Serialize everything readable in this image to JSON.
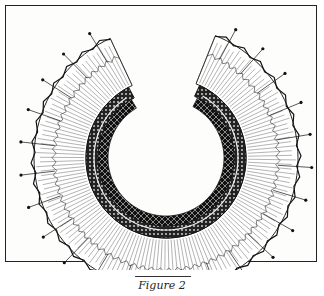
{
  "figure": {
    "caption": "Figure 2",
    "colors": {
      "ink": "#1a1a1a",
      "paper": "#fdfdfb"
    }
  }
}
